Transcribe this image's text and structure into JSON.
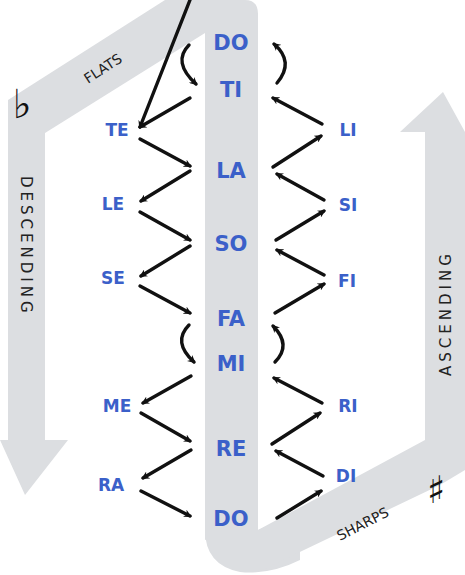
{
  "diagram": {
    "type": "solfege-chromatic-scale",
    "colors": {
      "syllable_text": "#3b60c9",
      "band_fill": "#dcdee1",
      "arrow": "#111111",
      "label_text": "#222222"
    },
    "center_column": {
      "syllables": [
        "DO",
        "TI",
        "LA",
        "SO",
        "FA",
        "MI",
        "RE",
        "DO"
      ]
    },
    "flats_side": {
      "label": "FLATS",
      "symbol": "♭",
      "direction_label": "DESCENDING",
      "syllables": [
        "TE",
        "LE",
        "SE",
        "ME",
        "RA"
      ]
    },
    "sharps_side": {
      "label": "SHARPS",
      "symbol": "♯",
      "direction_label": "ASCENDING",
      "syllables": [
        "LI",
        "SI",
        "FI",
        "RI",
        "DI"
      ]
    }
  }
}
